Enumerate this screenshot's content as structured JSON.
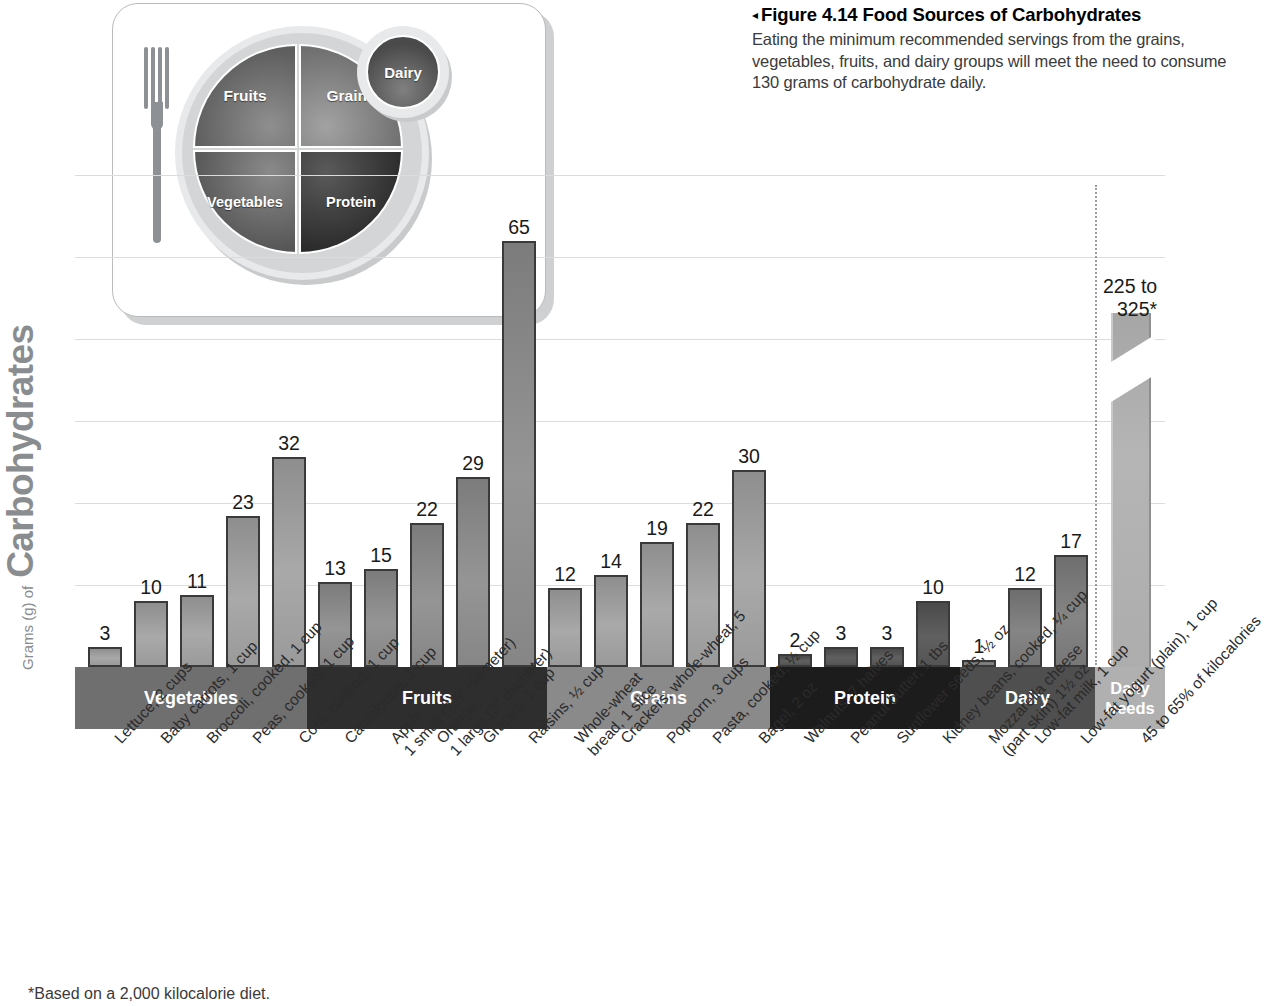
{
  "caption": {
    "arrow": "◂",
    "title": "Figure 4.14  Food Sources of Carbohydrates",
    "body": "Eating the minimum recommended servings from the grains, vegetables, fruits, and dairy groups will meet the need to consume 130 grams of carbohydrate daily."
  },
  "myplate": {
    "fruits": "Fruits",
    "grains": "Grains",
    "vegetables": "Vegetables",
    "protein": "Protein",
    "dairy": "Dairy"
  },
  "axis": {
    "y_small": "Grams (g) of",
    "y_big": "Carbohydrates"
  },
  "daily_needs": {
    "value_label_line1": "225 to",
    "value_label_line2": "325*"
  },
  "footnote": "*Based on a 2,000 kilocalorie diet.",
  "colors": {
    "band_vegetables": "#6f6f6f",
    "band_fruits": "#2e2e2e",
    "band_grains": "#8a8a8a",
    "band_protein": "#1c1c1c",
    "band_dairy": "#4f4f4f",
    "band_daily_needs": "#b0b0b0",
    "gridline": "#dcdcdc",
    "axis_title": "#8a8d90",
    "caption_body": "#3b3b3b"
  },
  "chart_data": {
    "type": "bar",
    "title": "Food Sources of Carbohydrates",
    "xlabel": "",
    "ylabel": "Grams (g) of Carbohydrates",
    "ylim": [
      0,
      70
    ],
    "grid": true,
    "gridlines": [
      10,
      20,
      30,
      40,
      50,
      60
    ],
    "legend": null,
    "annotations": [
      "*Based on a 2,000 kilocalorie diet."
    ],
    "categories": [
      "Lettuce, 2 cups",
      "Baby carrots, 1 cup",
      "Broccoli, cooked, 1 cup",
      "Peas, cooked, 1 cup",
      "Corn, cooked, 1 cup",
      "Cantaloupe, 1 cup",
      "Apple, 1 small (2.5\" diameter)",
      "Orange, 1 large (3\" diameter)",
      "Grapes, 1 cup",
      "Raisins, 1/2 cup",
      "Whole-wheat bread, 1 slice",
      "Crackers, whole-wheat, 5",
      "Popcorn, 3 cups",
      "Pasta, cooked, 1/2 cup",
      "Bagel, 2 oz",
      "Walnuts, 7 halves",
      "Peanut butter, 1 tbs",
      "Sunflower seeds, 1/2 oz",
      "Kidney beans, cooked, 1/4 cup",
      "Mozzarella cheese (part skim) 1 1/2 oz",
      "Low-fat milk, 1 cup",
      "Low-fat yogurt (plain), 1 cup",
      "45 to 65% of kilocalories"
    ],
    "values": [
      3,
      10,
      11,
      23,
      32,
      13,
      15,
      22,
      29,
      65,
      12,
      14,
      19,
      22,
      30,
      2,
      3,
      3,
      10,
      1,
      12,
      17,
      275
    ],
    "value_labels": [
      "3",
      "10",
      "11",
      "23",
      "32",
      "13",
      "15",
      "22",
      "29",
      "65",
      "12",
      "14",
      "19",
      "22",
      "30",
      "2",
      "3",
      "3",
      "10",
      "1",
      "12",
      "17",
      "225 to 325*"
    ],
    "groups": [
      {
        "label": "Vegetables",
        "count": 5,
        "color": "#6f6f6f"
      },
      {
        "label": "Fruits",
        "count": 5,
        "color": "#2e2e2e"
      },
      {
        "label": "Grains",
        "count": 5,
        "color": "#8a8a8a"
      },
      {
        "label": "Protein",
        "count": 4,
        "color": "#1c1c1c"
      },
      {
        "label": "Dairy",
        "count": 3,
        "color": "#4f4f4f"
      },
      {
        "label": "Daily Needs",
        "count": 1,
        "color": "#b0b0b0"
      }
    ]
  }
}
